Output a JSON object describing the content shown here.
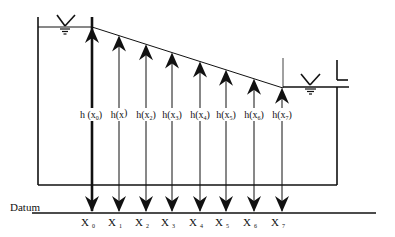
{
  "diagram": {
    "type": "hydraulic-head-profile",
    "datum_label": "Datum",
    "head_labels": [
      {
        "base": "h",
        "var": "x",
        "sub": "0"
      },
      {
        "base": "h",
        "var": "x",
        "sub": ""
      },
      {
        "base": "h",
        "var": "x",
        "sub": "2"
      },
      {
        "base": "h",
        "var": "x",
        "sub": "3"
      },
      {
        "base": "h",
        "var": "x",
        "sub": "4"
      },
      {
        "base": "h",
        "var": "x",
        "sub": "5"
      },
      {
        "base": "h",
        "var": "x",
        "sub": "6"
      },
      {
        "base": "h",
        "var": "x",
        "sub": "7"
      }
    ],
    "x_labels": [
      {
        "var": "X",
        "sub": "0"
      },
      {
        "var": "X",
        "sub": "1"
      },
      {
        "var": "X",
        "sub": "2"
      },
      {
        "var": "X",
        "sub": "3"
      },
      {
        "var": "X",
        "sub": "4"
      },
      {
        "var": "X",
        "sub": "5"
      },
      {
        "var": "X",
        "sub": "6"
      },
      {
        "var": "X",
        "sub": "7"
      }
    ],
    "water_surface_symbols": [
      "left-reservoir",
      "right-reservoir"
    ],
    "line_color": "#111111",
    "background": "#ffffff"
  }
}
